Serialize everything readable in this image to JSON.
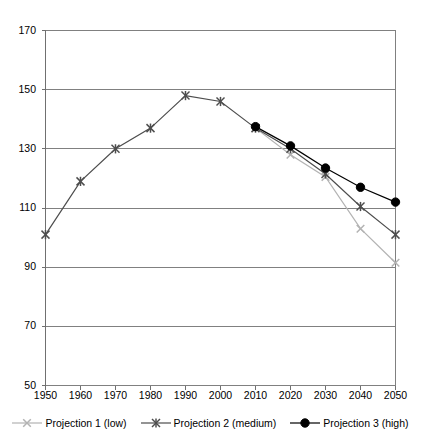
{
  "chart_data": {
    "type": "line",
    "title": "",
    "subtitle": "",
    "xlabel": "",
    "ylabel": "",
    "x": [
      1950,
      1960,
      1970,
      1980,
      1990,
      2000,
      2010,
      2020,
      2030,
      2040,
      2050
    ],
    "xlim": [
      1950,
      2050
    ],
    "ylim": [
      50,
      170
    ],
    "ytick_values": [
      50,
      70,
      90,
      110,
      130,
      150,
      170
    ],
    "ytick_labels": [
      "50",
      "70",
      "90",
      "110",
      "130",
      "150",
      "170"
    ],
    "xtick_labels": [
      "1950",
      "1960",
      "1970",
      "1980",
      "1990",
      "2000",
      "2010",
      "2020",
      "2030",
      "2040",
      "2050"
    ],
    "grid": "horizontal",
    "legend_position": "bottom",
    "series": [
      {
        "name": "Projection 1 (low)",
        "marker": "x",
        "color": "#b3b3b3",
        "x": [
          2010,
          2020,
          2030,
          2040,
          2050
        ],
        "values": [
          137,
          128,
          120.5,
          103,
          91.5
        ]
      },
      {
        "name": "Projection 2 (medium)",
        "marker": "asterisk",
        "color": "#4d4d4d",
        "x": [
          1950,
          1960,
          1970,
          1980,
          1990,
          2000,
          2010,
          2020,
          2030,
          2040,
          2050
        ],
        "values": [
          101,
          119,
          130,
          137,
          148,
          146,
          137,
          130,
          121.5,
          110.5,
          101
        ]
      },
      {
        "name": "Projection 3 (high)",
        "marker": "circle",
        "color": "#000000",
        "x": [
          2010,
          2020,
          2030,
          2040,
          2050
        ],
        "values": [
          137.5,
          131,
          123.5,
          117,
          112
        ]
      }
    ]
  },
  "legend": {
    "items": [
      {
        "label": "Projection 1 (low)",
        "marker": "x",
        "color": "#b3b3b3"
      },
      {
        "label": "Projection 2 (medium)",
        "marker": "asterisk",
        "color": "#4d4d4d"
      },
      {
        "label": "Projection 3 (high)",
        "marker": "circle",
        "color": "#000000"
      }
    ]
  },
  "axes": {
    "frame_color": "#808080",
    "grid_color": "#808080",
    "background": "#ffffff"
  }
}
